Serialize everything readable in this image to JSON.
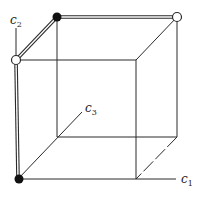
{
  "diagram": {
    "type": "unit-cube",
    "axes": [
      {
        "id": "c1",
        "label": "c",
        "subscript": "1"
      },
      {
        "id": "c2",
        "label": "c",
        "subscript": "2"
      },
      {
        "id": "c3",
        "label": "c",
        "subscript": "3"
      }
    ],
    "vertices": {
      "filled": [
        "origin",
        "top-back-left"
      ],
      "open": [
        "c2-end",
        "top-back-right"
      ]
    },
    "highlighted_path": [
      "origin",
      "c2-end",
      "top-back-left",
      "top-back-right"
    ],
    "colors": {
      "line": "#2a2a2a",
      "background": "#ffffff"
    }
  }
}
